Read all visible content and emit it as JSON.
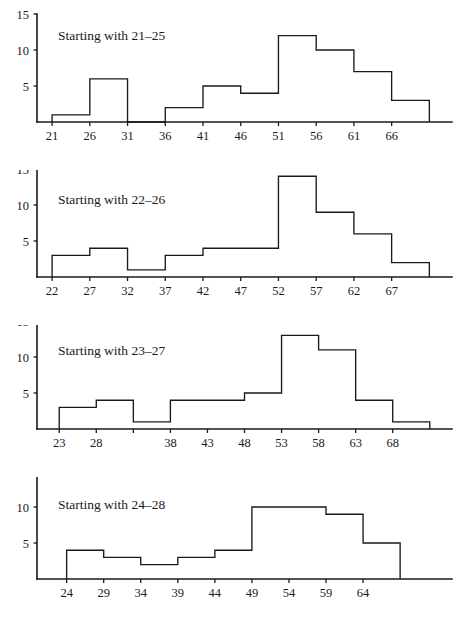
{
  "figure": {
    "background_color": "#ffffff",
    "line_color": "#1a1a1a",
    "panel_count": 4
  },
  "chart_data": [
    {
      "type": "bar",
      "title": "Starting with 21–25",
      "xlabel": "",
      "ylabel": "",
      "ylim": [
        0,
        15
      ],
      "yticks": [
        5,
        10,
        15
      ],
      "ytick_labels": [
        "5",
        "10",
        "15"
      ],
      "xticks": [
        21,
        26,
        31,
        36,
        41,
        46,
        51,
        56,
        61,
        66
      ],
      "xtick_labels": [
        "21",
        "26",
        "31",
        "36",
        "41",
        "46",
        "51",
        "56",
        "61",
        "66"
      ],
      "xlim": [
        19,
        74
      ],
      "bin_width": 5,
      "bin_starts": [
        21,
        26,
        31,
        36,
        41,
        46,
        51,
        56,
        61,
        66
      ],
      "bin_labels": [
        "21–26",
        "26–31",
        "31–36",
        "36–41",
        "41–46",
        "46–51",
        "51–56",
        "56–61",
        "61–66",
        "66–71"
      ],
      "values": [
        1,
        6,
        0,
        2,
        5,
        4,
        12,
        10,
        7,
        3
      ],
      "grid": false,
      "legend": "none"
    },
    {
      "type": "bar",
      "title": "Starting with 22–26",
      "xlabel": "",
      "ylabel": "",
      "ylim": [
        0,
        15
      ],
      "yticks": [
        5,
        10,
        15
      ],
      "ytick_labels": [
        "5",
        "10",
        "15"
      ],
      "xticks": [
        22,
        27,
        32,
        37,
        42,
        47,
        52,
        57,
        62,
        67
      ],
      "xtick_labels": [
        "22",
        "27",
        "32",
        "37",
        "42",
        "47",
        "52",
        "57",
        "62",
        "67"
      ],
      "xlim": [
        20,
        75
      ],
      "bin_width": 5,
      "bin_starts": [
        22,
        27,
        32,
        37,
        42,
        47,
        52,
        57,
        62,
        67
      ],
      "bin_labels": [
        "22–27",
        "27–32",
        "32–37",
        "37–42",
        "42–47",
        "47–52",
        "52–57",
        "57–62",
        "62–67",
        "67–72"
      ],
      "values": [
        3,
        4,
        1,
        3,
        4,
        4,
        14,
        9,
        6,
        2
      ],
      "grid": false,
      "legend": "none"
    },
    {
      "type": "bar",
      "title": "Starting with 23–27",
      "xlabel": "",
      "ylabel": "",
      "ylim": [
        0,
        15
      ],
      "yticks": [
        5,
        10,
        15
      ],
      "ytick_labels": [
        "5",
        "10",
        "15"
      ],
      "xticks": [
        23,
        28,
        33,
        38,
        43,
        48,
        53,
        58,
        63,
        68
      ],
      "xtick_labels": [
        "23",
        "28",
        "",
        "38",
        "43",
        "48",
        "53",
        "58",
        "63",
        "68"
      ],
      "xlim": [
        20,
        76
      ],
      "bin_width": 5,
      "bin_starts": [
        23,
        28,
        33,
        38,
        43,
        48,
        53,
        58,
        63,
        68
      ],
      "bin_labels": [
        "23–28",
        "28–33",
        "33–38",
        "38–43",
        "43–48",
        "48–53",
        "53–58",
        "58–63",
        "63–68",
        "68–73"
      ],
      "values": [
        3,
        4,
        1,
        4,
        4,
        5,
        13,
        11,
        4,
        1
      ],
      "grid": false,
      "legend": "none"
    },
    {
      "type": "bar",
      "title": "Starting with 24–28",
      "xlabel": "",
      "ylabel": "",
      "ylim": [
        0,
        15
      ],
      "yticks": [
        5,
        10,
        15
      ],
      "ytick_labels": [
        "5",
        "10",
        "15"
      ],
      "xticks": [
        24,
        29,
        34,
        39,
        44,
        49,
        54,
        59,
        64
      ],
      "xtick_labels": [
        "24",
        "29",
        "34",
        "39",
        "44",
        "49",
        "54",
        "59",
        "64"
      ],
      "xlim": [
        20,
        76
      ],
      "bin_width": 5,
      "bin_starts": [
        24,
        29,
        34,
        39,
        44,
        49,
        54,
        59,
        64
      ],
      "bin_labels": [
        "24–29",
        "29–34",
        "34–39",
        "39–44",
        "44–49",
        "49–54",
        "54–59",
        "59–64",
        "64–69"
      ],
      "values": [
        4,
        3,
        2,
        3,
        4,
        10,
        10,
        9,
        5
      ],
      "grid": false,
      "legend": "none"
    }
  ]
}
